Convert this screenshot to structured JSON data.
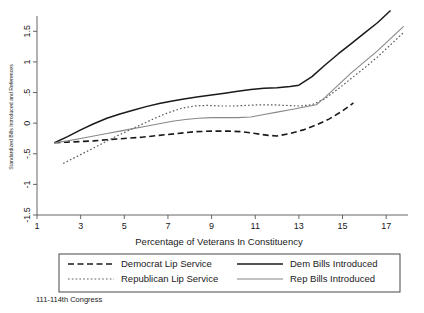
{
  "figure": {
    "note": "111-114th Congress"
  },
  "chart_data": {
    "type": "line",
    "title": "",
    "xlabel": "Percentage of Veterans In Constituency",
    "ylabel": "Standardized Bills Introduced and References",
    "xlim": [
      1,
      18
    ],
    "ylim": [
      -1.5,
      1.75
    ],
    "xticks": [
      1,
      3,
      5,
      7,
      9,
      11,
      13,
      15,
      17
    ],
    "xtick_labels": [
      "1",
      "3",
      "5",
      "7",
      "9",
      "11",
      "13",
      "15",
      "17"
    ],
    "yticks": [
      -1.5,
      -1,
      -0.5,
      0,
      0.5,
      1,
      1.5
    ],
    "ytick_labels": [
      "-1.5",
      "-1",
      "-.5",
      "0",
      ".5",
      "1",
      "1.5"
    ],
    "grid": false,
    "legend_position": "below-axes",
    "series": [
      {
        "name": "Democrat Lip Service",
        "style": "dashed",
        "color": "#1a1a1a",
        "width": 1.6,
        "dash": "6,3.5",
        "x": [
          1.8,
          2.4,
          3.0,
          3.6,
          4.2,
          5.0,
          5.8,
          6.6,
          7.4,
          8.2,
          9.0,
          9.8,
          10.4,
          11.0,
          11.6,
          12.0,
          12.6,
          13.2,
          13.8,
          14.4,
          15.0,
          15.5
        ],
        "y": [
          -0.32,
          -0.31,
          -0.3,
          -0.29,
          -0.27,
          -0.25,
          -0.23,
          -0.2,
          -0.17,
          -0.14,
          -0.13,
          -0.13,
          -0.14,
          -0.17,
          -0.2,
          -0.21,
          -0.17,
          -0.11,
          -0.03,
          0.07,
          0.2,
          0.33
        ]
      },
      {
        "name": "Republican Lip Service",
        "style": "dotted",
        "color": "#5a5a5a",
        "width": 1.2,
        "dash": "1.6,2.2",
        "x": [
          2.2,
          2.8,
          3.4,
          4.0,
          4.6,
          5.2,
          5.8,
          6.4,
          7.0,
          7.6,
          8.2,
          8.8,
          9.4,
          10.0,
          10.6,
          11.2,
          11.8,
          12.4,
          13.0,
          13.6,
          14.2,
          14.8,
          15.4,
          16.0,
          16.6,
          17.2,
          17.8
        ],
        "y": [
          -0.66,
          -0.55,
          -0.44,
          -0.33,
          -0.22,
          -0.12,
          -0.02,
          0.08,
          0.17,
          0.24,
          0.28,
          0.29,
          0.28,
          0.28,
          0.29,
          0.3,
          0.3,
          0.29,
          0.28,
          0.3,
          0.4,
          0.56,
          0.73,
          0.9,
          1.08,
          1.28,
          1.48
        ]
      },
      {
        "name": "Dem Bills Introduced",
        "style": "solid",
        "color": "#1a1a1a",
        "width": 1.5,
        "dash": "none",
        "x": [
          1.8,
          2.4,
          3.0,
          3.6,
          4.2,
          4.8,
          5.4,
          6.0,
          6.6,
          7.2,
          7.8,
          8.4,
          9.0,
          9.6,
          10.2,
          10.8,
          11.4,
          12.0,
          12.6,
          13.0,
          13.6,
          14.2,
          14.8,
          15.4,
          16.0,
          16.6,
          17.2
        ],
        "y": [
          -0.32,
          -0.22,
          -0.11,
          -0.01,
          0.08,
          0.15,
          0.21,
          0.27,
          0.32,
          0.36,
          0.4,
          0.43,
          0.46,
          0.49,
          0.52,
          0.55,
          0.57,
          0.58,
          0.6,
          0.62,
          0.76,
          0.95,
          1.13,
          1.3,
          1.47,
          1.64,
          1.84
        ]
      },
      {
        "name": "Rep Bills Introduced",
        "style": "solid",
        "color": "#888888",
        "width": 1.1,
        "dash": "none",
        "x": [
          1.8,
          2.4,
          3.0,
          3.6,
          4.2,
          4.8,
          5.4,
          6.0,
          6.6,
          7.2,
          7.8,
          8.4,
          9.0,
          9.6,
          10.2,
          10.8,
          11.4,
          12.0,
          12.6,
          13.2,
          13.8,
          14.2,
          14.8,
          15.4,
          16.0,
          16.6,
          17.2,
          17.8
        ],
        "y": [
          -0.32,
          -0.29,
          -0.25,
          -0.21,
          -0.17,
          -0.13,
          -0.09,
          -0.05,
          -0.01,
          0.03,
          0.06,
          0.08,
          0.09,
          0.09,
          0.09,
          0.1,
          0.14,
          0.18,
          0.22,
          0.26,
          0.3,
          0.42,
          0.62,
          0.82,
          1.0,
          1.18,
          1.38,
          1.58
        ]
      }
    ]
  },
  "legend": {
    "entries": [
      {
        "label": "Democrat Lip Service",
        "series": 0
      },
      {
        "label": "Dem Bills Introduced",
        "series": 2
      },
      {
        "label": "Republican Lip Service",
        "series": 1
      },
      {
        "label": "Rep Bills Introduced",
        "series": 3
      }
    ]
  }
}
